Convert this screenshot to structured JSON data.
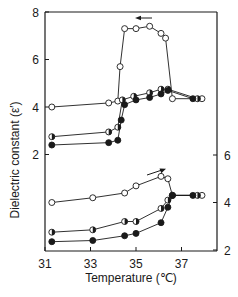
{
  "chart_data": {
    "type": "line",
    "title": "",
    "xlabel": "Temperature (℃)",
    "ylabel": "Dielectric constant (ε′)",
    "xlim": [
      31,
      38.2
    ],
    "x_ticks": [
      31,
      33,
      35,
      37
    ],
    "grid": false,
    "legend": "none",
    "panels": [
      {
        "name": "cooling",
        "axis": "left",
        "arrow": "left",
        "ylim": [
          2,
          8
        ],
        "y_ticks": [
          2,
          4,
          6,
          8
        ],
        "series": [
          {
            "name": "open-circle",
            "marker": "open",
            "x": [
              31.3,
              33.8,
              34.2,
              34.3,
              34.5,
              35.0,
              35.6,
              36.1,
              36.3,
              36.6,
              37.9
            ],
            "y": [
              4.0,
              4.17,
              4.25,
              5.7,
              7.3,
              7.3,
              7.4,
              7.1,
              6.9,
              4.35,
              4.35
            ]
          },
          {
            "name": "half-filled-circle",
            "marker": "half",
            "x": [
              31.3,
              33.8,
              34.2,
              34.4,
              34.9,
              35.6,
              36.1,
              36.4,
              37.7
            ],
            "y": [
              2.75,
              2.95,
              3.15,
              4.3,
              4.45,
              4.6,
              4.75,
              4.75,
              4.35
            ]
          },
          {
            "name": "filled-circle",
            "marker": "filled",
            "x": [
              31.3,
              33.8,
              34.2,
              34.35,
              34.5,
              35.0,
              35.6,
              36.1,
              36.4,
              37.5
            ],
            "y": [
              2.4,
              2.5,
              2.6,
              3.45,
              4.1,
              4.3,
              4.4,
              4.55,
              4.7,
              4.35
            ]
          }
        ]
      },
      {
        "name": "heating",
        "axis": "right",
        "arrow": "right",
        "ylim": [
          2,
          6
        ],
        "y_ticks": [
          2,
          4,
          6
        ],
        "series": [
          {
            "name": "open-circle",
            "marker": "open",
            "x": [
              31.3,
              33.1,
              34.5,
              35.0,
              36.1,
              36.4,
              36.6,
              37.9
            ],
            "y": [
              4.0,
              4.2,
              4.4,
              4.7,
              5.1,
              5.0,
              4.3,
              4.3
            ]
          },
          {
            "name": "half-filled-circle",
            "marker": "half",
            "x": [
              31.3,
              33.1,
              34.5,
              35.0,
              36.1,
              36.4,
              36.6,
              37.7
            ],
            "y": [
              2.75,
              2.85,
              3.2,
              3.2,
              3.75,
              4.1,
              4.3,
              4.3
            ]
          },
          {
            "name": "filled-circle",
            "marker": "filled",
            "x": [
              31.3,
              33.1,
              34.5,
              35.0,
              36.1,
              36.4,
              36.6,
              37.5
            ],
            "y": [
              2.35,
              2.4,
              2.6,
              2.7,
              3.15,
              3.8,
              4.3,
              4.3
            ]
          }
        ]
      }
    ]
  },
  "labels": {
    "ylabel": "Dielectric constant (ε′)",
    "xlabel": "Temperature (℃)"
  },
  "colors": {
    "ink": "#1a1a1a",
    "marker_fill_open": "#ffffff",
    "marker_fill_filled": "#1a1a1a"
  }
}
